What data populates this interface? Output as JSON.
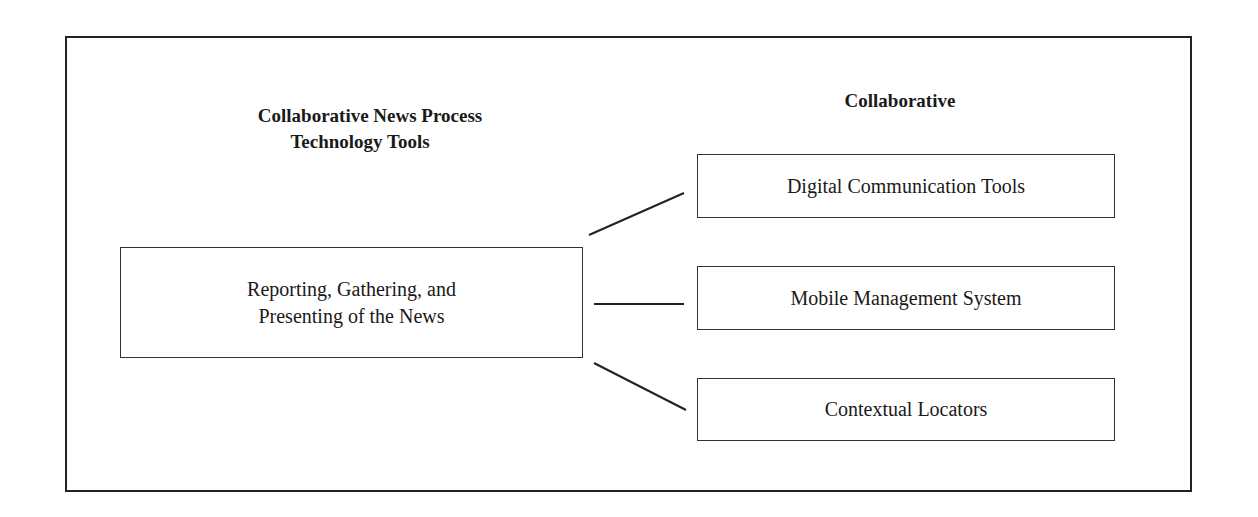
{
  "diagram": {
    "left_heading": {
      "line1": "Collaborative News Process",
      "line2": "Technology Tools"
    },
    "right_heading": "Collaborative",
    "source_node": {
      "line1": "Reporting, Gathering, and",
      "line2": "Presenting of the News"
    },
    "target_nodes": [
      {
        "label": "Digital Communication Tools"
      },
      {
        "label": "Mobile Management System"
      },
      {
        "label": "Contextual Locators"
      }
    ],
    "colors": {
      "stroke": "#222222",
      "background": "#ffffff"
    }
  }
}
